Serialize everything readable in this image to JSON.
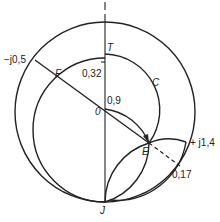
{
  "diagram": {
    "type": "smith-chart-construction",
    "labels": {
      "minus_j05": "−j0,5",
      "F": "F",
      "T": "T",
      "val_032": "0,32",
      "C": "C",
      "O": "0",
      "val_09": "0,9",
      "E": "E",
      "plus_j14": "+ j1,4",
      "val_017": "0,17",
      "J": "J"
    },
    "colors": {
      "line": "#222222",
      "background": "#ffffff"
    }
  }
}
